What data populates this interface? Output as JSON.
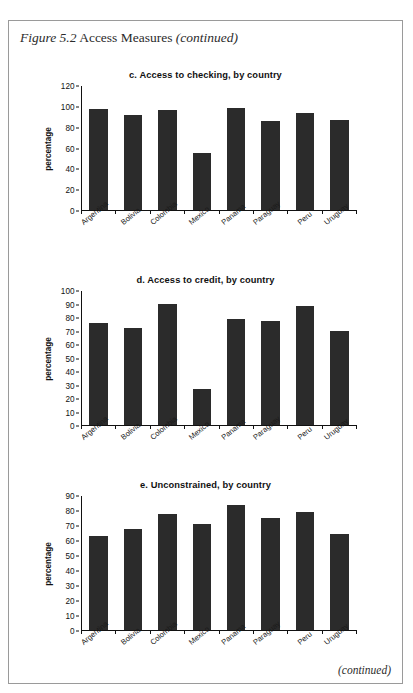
{
  "figure": {
    "label_italic": "Figure 5.2",
    "label_roman": "Access Measures",
    "label_continued": "(continued)"
  },
  "footer": {
    "continued": "(continued)"
  },
  "chart_data": [
    {
      "id": "c",
      "type": "bar",
      "title": "c. Access to checking, by country",
      "xlabel": "",
      "ylabel": "percentage",
      "ylim": [
        0,
        120
      ],
      "ytick_step": 20,
      "yticks": [
        0,
        20,
        40,
        60,
        80,
        100,
        120
      ],
      "grid": false,
      "legend": "none",
      "bar_color": "#2b2b2b",
      "categories": [
        "Argentina",
        "Bolivia",
        "Colombia",
        "Mexico",
        "Panama",
        "Paraguay",
        "Peru",
        "Uruguay"
      ],
      "values": [
        98,
        92,
        97,
        55.5,
        98.5,
        86,
        94,
        87.5
      ]
    },
    {
      "id": "d",
      "type": "bar",
      "title": "d. Access to credit, by country",
      "xlabel": "",
      "ylabel": "percentage",
      "ylim": [
        0,
        100
      ],
      "ytick_step": 10,
      "yticks": [
        0,
        10,
        20,
        30,
        40,
        50,
        60,
        70,
        80,
        90,
        100
      ],
      "grid": false,
      "legend": "none",
      "bar_color": "#2b2b2b",
      "categories": [
        "Argentina",
        "Bolivia",
        "Colombia",
        "Mexico",
        "Panama",
        "Paraguay",
        "Peru",
        "Uruguay"
      ],
      "values": [
        76,
        72.5,
        90,
        27,
        79,
        77.5,
        88.5,
        70.5
      ]
    },
    {
      "id": "e",
      "type": "bar",
      "title": "e. Unconstrained, by country",
      "xlabel": "",
      "ylabel": "percentage",
      "ylim": [
        0,
        90
      ],
      "ytick_step": 10,
      "yticks": [
        0,
        10,
        20,
        30,
        40,
        50,
        60,
        70,
        80,
        90
      ],
      "grid": false,
      "legend": "none",
      "bar_color": "#2b2b2b",
      "categories": [
        "Argentina",
        "Bolivia",
        "Colombia",
        "Mexico",
        "Panama",
        "Paraguay",
        "Peru",
        "Uruguay"
      ],
      "values": [
        63,
        68,
        78,
        71,
        84,
        75,
        79,
        64.5
      ]
    }
  ]
}
